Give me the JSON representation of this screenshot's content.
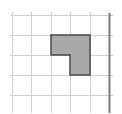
{
  "diagram": {
    "type": "grid-shape",
    "grid": {
      "vertical_lines_x": [
        12,
        31,
        51,
        70,
        90
      ],
      "horizontal_lines_y": [
        15,
        35,
        55,
        75,
        95
      ],
      "x_extent": [
        10,
        113
      ],
      "y_extent": [
        12,
        113
      ],
      "line_color": "#cfcfcf"
    },
    "thick_line": {
      "x": 109,
      "y_extent": [
        13,
        113
      ],
      "color": "#7a7a7a"
    },
    "shape": {
      "points": "51,35 90,35 90,75 70,75 70,55 51,55",
      "fill": "#a9a9a9",
      "stroke": "#4a4a4a",
      "grid_cells": "L-shape covering 3 unit squares"
    }
  }
}
